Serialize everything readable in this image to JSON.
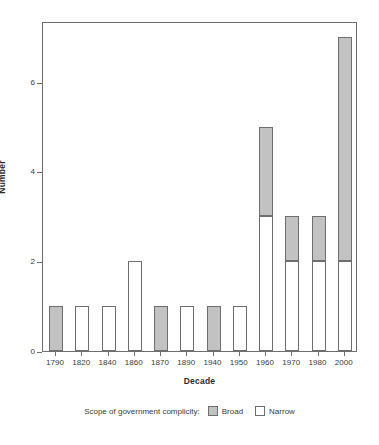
{
  "chart_data": {
    "type": "bar",
    "stacked": true,
    "title": "",
    "xlabel": "Decade",
    "ylabel": "Number",
    "categories": [
      "1790",
      "1820",
      "1840",
      "1860",
      "1870",
      "1890",
      "1940",
      "1950",
      "1960",
      "1970",
      "1980",
      "2000"
    ],
    "series": [
      {
        "name": "Narrow",
        "color": "#ffffff",
        "values": [
          0,
          1,
          1,
          2,
          0,
          1,
          0,
          1,
          3,
          2,
          2,
          2
        ]
      },
      {
        "name": "Broad",
        "color": "#c2c2c2",
        "values": [
          1,
          0,
          0,
          0,
          1,
          0,
          1,
          0,
          2,
          1,
          1,
          5
        ]
      }
    ],
    "totals": [
      1,
      1,
      1,
      2,
      1,
      1,
      1,
      1,
      5,
      3,
      3,
      7
    ],
    "ylim": [
      0,
      7.35
    ],
    "yticks": [
      0,
      2,
      4,
      6
    ],
    "ytick_labels": [
      "0",
      "2",
      "4",
      "6"
    ],
    "grid": false,
    "legend_position": "bottom",
    "legend_title": "Scope of government complicity:"
  },
  "axes": {
    "y_title": "Number",
    "x_title": "Decade"
  },
  "legend": {
    "title": "Scope of government complicity:",
    "entries": [
      {
        "label": "Broad",
        "swatch": "#c2c2c2"
      },
      {
        "label": "Narrow",
        "swatch": "#ffffff"
      }
    ]
  }
}
